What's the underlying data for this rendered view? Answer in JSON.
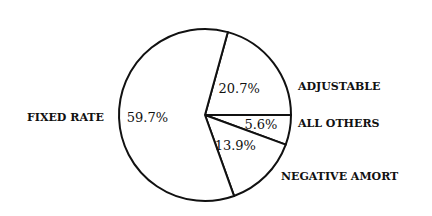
{
  "chart_data": {
    "type": "pie",
    "title": "",
    "slices": [
      {
        "label": "ADJUSTABLE",
        "value": 20.7,
        "value_label": "20.7%"
      },
      {
        "label": "ALL OTHERS",
        "value": 5.6,
        "value_label": "5.6%"
      },
      {
        "label": "NEGATIVE AMORT",
        "value": 13.9,
        "value_label": "13.9%"
      },
      {
        "label": "FIXED RATE",
        "value": 59.7,
        "value_label": "59.7%"
      }
    ],
    "start": "3 o'clock, ADJUSTABLE above horizontal, others clockwise below",
    "colors": {
      "fill": "#ffffff",
      "stroke": "#111111",
      "text": "#111111"
    },
    "legend": "none (labels outside slices)"
  }
}
